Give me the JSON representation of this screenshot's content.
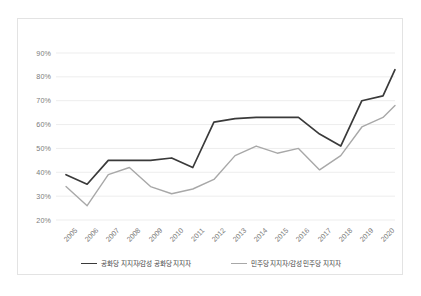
{
  "chart_data": {
    "type": "line",
    "title": "",
    "subtitle": "",
    "xlabel": "",
    "ylabel": "",
    "grid": true,
    "legend_position": "bottom",
    "ylim": [
      20,
      90
    ],
    "ytick_labels": [
      "90%",
      "80%",
      "70%",
      "60%",
      "50%",
      "40%",
      "30%",
      "20%"
    ],
    "ytick_values": [
      90,
      80,
      70,
      60,
      50,
      40,
      30,
      20
    ],
    "categories": [
      "2005",
      "2006",
      "2007",
      "2008",
      "2009",
      "2010",
      "2011",
      "2012",
      "2013",
      "2014",
      "2015",
      "2016",
      "2017",
      "2018",
      "2019",
      "2020"
    ],
    "series": [
      {
        "name": "공화당 지지자/감성 공화당 지지자",
        "color": "#3a3a3a",
        "values": [
          39,
          35,
          45,
          45,
          45,
          46,
          42,
          61,
          62.5,
          63,
          63,
          63,
          56,
          51,
          70,
          72
        ]
      },
      {
        "name": "민주당 지지자/감성 민주당 지지자",
        "color": "#a8a8a8",
        "values": [
          34,
          26,
          39,
          42,
          34,
          31,
          33,
          37,
          47,
          51,
          48,
          50,
          41,
          47,
          59,
          63
        ]
      }
    ],
    "series_tail_extension": {
      "note": "both lines extend past the 2020 tick to the plot right edge",
      "republican_end_value": 83,
      "democrat_end_value": 68
    }
  },
  "legend": {
    "items": [
      {
        "label": "공화당 지지자/감성 공화당 지지자",
        "color": "#3a3a3a"
      },
      {
        "label": "민주당 지지자/감성 민주당 지지자",
        "color": "#a8a8a8"
      }
    ]
  },
  "colors": {
    "background": "#ffffff",
    "card_border": "#e3e3e3",
    "gridline": "#ededed",
    "tick_text": "#7b7b7b",
    "legend_text": "#3f3f3f",
    "series_republican": "#3a3a3a",
    "series_democrat": "#a8a8a8"
  }
}
